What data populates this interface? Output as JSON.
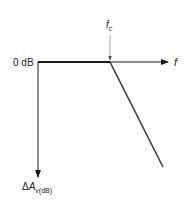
{
  "diagram": {
    "type": "bode-magnitude-asymptote",
    "y_reference_label": "0 dB",
    "x_axis_label": "f",
    "corner_frequency_label": {
      "base": "f",
      "sub": "c"
    },
    "y_axis_label": {
      "prefix": "Δ",
      "base": "A",
      "sub": "v(dB)"
    },
    "colors": {
      "line": "#1a1a1a",
      "marker": "#888888",
      "text": "#222222"
    }
  }
}
